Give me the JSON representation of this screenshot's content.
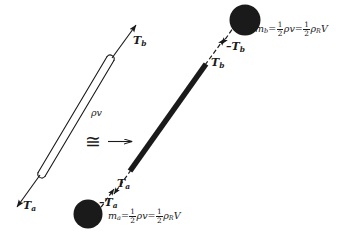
{
  "figure": {
    "domain": "physics-free-body-diagram",
    "background_color": "#ffffff",
    "ink_color": "#1a1a1a",
    "width": 343,
    "height": 241
  },
  "left_model": {
    "name": "hollow-rod-with-distributed-mass",
    "rod_label": "ρv",
    "tension_top_label": "T",
    "tension_top_sub": "b",
    "tension_bottom_label": "T",
    "tension_bottom_sub": "a"
  },
  "equivalence": {
    "symbol": "≅",
    "arrow": "→"
  },
  "right_model": {
    "name": "massless-rod-with-two-point-masses",
    "rod_tension_top_label": "T",
    "rod_tension_top_sub": "b",
    "rod_tension_bottom_label": "T",
    "rod_tension_bottom_sub": "a",
    "mass_top": {
      "reaction_label": "–T",
      "reaction_sub": "b",
      "formula": {
        "symbol": "m",
        "symbol_sub": "b",
        "eq1": "=",
        "frac1_num": "1",
        "frac1_den": "2",
        "term1": "ρv",
        "eq2": "=",
        "frac2_num": "1",
        "frac2_den": "2",
        "term2_rho": "ρ",
        "term2_rho_sub": "R",
        "term2_v": "V"
      }
    },
    "mass_bottom": {
      "reaction_label": "–T",
      "reaction_sub": "a",
      "formula": {
        "symbol": "m",
        "symbol_sub": "a",
        "eq1": "=",
        "frac1_num": "1",
        "frac1_den": "2",
        "term1": "ρv",
        "eq2": "=",
        "frac2_num": "1",
        "frac2_den": "2",
        "term2_rho": "ρ",
        "term2_rho_sub": "R",
        "term2_v": "V"
      }
    }
  }
}
